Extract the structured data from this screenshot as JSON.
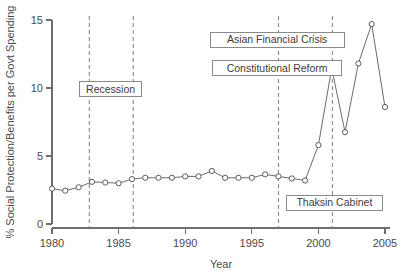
{
  "chart_data": {
    "type": "line",
    "title": "",
    "xlabel": "Year",
    "ylabel": "% Social Protection/Benefits per Govt Spending",
    "xlim": [
      1979.0,
      1985.0
    ],
    "ylim": [
      0,
      15
    ],
    "xticks": [
      1980,
      1985,
      1990,
      1995,
      2000,
      2005
    ],
    "xtick_labels": [
      "1980",
      "1985",
      "1990",
      "1995",
      "2000",
      "2005"
    ],
    "yticks": [
      0,
      5,
      10,
      15
    ],
    "ytick_labels": [
      "0",
      "5",
      "10",
      "15"
    ],
    "grid": false,
    "legend": false,
    "marker": "open-circle",
    "x": [
      1980,
      1981,
      1982,
      1983,
      1984,
      1985,
      1986,
      1987,
      1988,
      1989,
      1990,
      1991,
      1992,
      1993,
      1994,
      1995,
      1996,
      1997,
      1998,
      1999,
      2000,
      2001,
      2002,
      2003,
      2004,
      2005
    ],
    "values": [
      2.6,
      2.45,
      2.7,
      3.1,
      3.05,
      3.0,
      3.3,
      3.4,
      3.4,
      3.4,
      3.5,
      3.5,
      3.9,
      3.4,
      3.4,
      3.4,
      3.65,
      3.5,
      3.35,
      3.2,
      5.8,
      11.45,
      6.75,
      11.8,
      14.7,
      8.6
    ],
    "series": [
      {
        "name": "% Social Protection/Benefits per Govt Spending",
        "values": [
          2.6,
          2.45,
          2.7,
          3.1,
          3.05,
          3.0,
          3.3,
          3.4,
          3.4,
          3.4,
          3.5,
          3.5,
          3.9,
          3.4,
          3.4,
          3.4,
          3.65,
          3.5,
          3.35,
          3.2,
          5.8,
          11.45,
          6.75,
          11.8,
          14.7,
          8.6
        ]
      }
    ],
    "event_lines": [
      {
        "id": "recession-start",
        "x": 1982.8
      },
      {
        "id": "recession-end",
        "x": 1986.1
      },
      {
        "id": "asian-financial-crisis",
        "x": 1997.0
      },
      {
        "id": "thaksin-cabinet",
        "x": 2001.05
      }
    ],
    "annotations": [
      {
        "id": "recession",
        "label": "Recession",
        "x": 1984.4,
        "y": 9.9
      },
      {
        "id": "asian-financial-crisis",
        "label": "Asian Financial Crisis",
        "x": 1996.9,
        "y": 13.55
      },
      {
        "id": "constitutional-reform",
        "label": "Constitutional Reform",
        "x": 1996.9,
        "y": 11.45
      },
      {
        "id": "thaksin-cabinet",
        "label": "Thaksin Cabinet",
        "x": 2001.2,
        "y": 1.55
      }
    ]
  },
  "colors": {
    "series_line": "#5a5a5a",
    "marker_stroke": "#4a4a4a",
    "marker_fill": "#ffffff",
    "axis": "#6e6e6e",
    "event_rule": "#8a8a8a",
    "annotation_border": "#7d7d7d",
    "text": "#3c3c3c",
    "background": "#ffffff"
  }
}
